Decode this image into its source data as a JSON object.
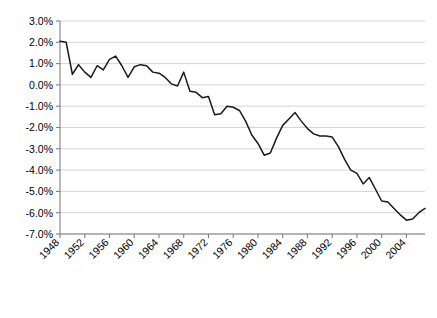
{
  "chart_data": {
    "type": "line",
    "title": "",
    "xlabel": "",
    "ylabel": "",
    "ylim": [
      -7.0,
      3.0
    ],
    "ytick_values": [
      3.0,
      2.0,
      1.0,
      0.0,
      -1.0,
      -2.0,
      -3.0,
      -4.0,
      -5.0,
      -6.0,
      -7.0
    ],
    "ytick_labels": [
      "3.0%",
      "2.0%",
      "1.0%",
      "0.0%",
      "-1.0%",
      "-2.0%",
      "-3.0%",
      "-4.0%",
      "-5.0%",
      "-6.0%",
      "-7.0%"
    ],
    "xlim": [
      1948,
      2007
    ],
    "xtick_values": [
      1948,
      1952,
      1956,
      1960,
      1964,
      1968,
      1972,
      1976,
      1980,
      1984,
      1988,
      1992,
      1996,
      2000,
      2004
    ],
    "xtick_labels": [
      "1948",
      "1952",
      "1956",
      "1960",
      "1964",
      "1968",
      "1972",
      "1976",
      "1980",
      "1984",
      "1988",
      "1992",
      "1996",
      "2000",
      "2004"
    ],
    "grid": true,
    "legend": "none",
    "x": [
      1948,
      1949,
      1950,
      1951,
      1952,
      1953,
      1954,
      1955,
      1956,
      1957,
      1958,
      1959,
      1960,
      1961,
      1962,
      1963,
      1964,
      1965,
      1966,
      1967,
      1968,
      1969,
      1970,
      1971,
      1972,
      1973,
      1974,
      1975,
      1976,
      1977,
      1978,
      1979,
      1980,
      1981,
      1982,
      1983,
      1984,
      1985,
      1986,
      1987,
      1988,
      1989,
      1990,
      1991,
      1992,
      1993,
      1994,
      1995,
      1996,
      1997,
      1998,
      1999,
      2000,
      2001,
      2002,
      2003,
      2004,
      2005,
      2006,
      2007
    ],
    "series": [
      {
        "name": "series-1",
        "values": [
          2.05,
          2.0,
          0.5,
          0.95,
          0.6,
          0.35,
          0.9,
          0.7,
          1.2,
          1.35,
          0.9,
          0.35,
          0.85,
          0.95,
          0.9,
          0.6,
          0.55,
          0.35,
          0.05,
          -0.05,
          0.6,
          -0.3,
          -0.35,
          -0.6,
          -0.55,
          -1.4,
          -1.35,
          -1.0,
          -1.05,
          -1.2,
          -1.7,
          -2.35,
          -2.75,
          -3.3,
          -3.2,
          -2.5,
          -1.9,
          -1.6,
          -1.3,
          -1.7,
          -2.05,
          -2.3,
          -2.4,
          -2.4,
          -2.45,
          -2.9,
          -3.5,
          -4.0,
          -4.15,
          -4.65,
          -4.35,
          -4.9,
          -5.45,
          -5.5,
          -5.8,
          -6.1,
          -6.35,
          -6.3,
          -6.0,
          -5.8
        ]
      }
    ]
  }
}
